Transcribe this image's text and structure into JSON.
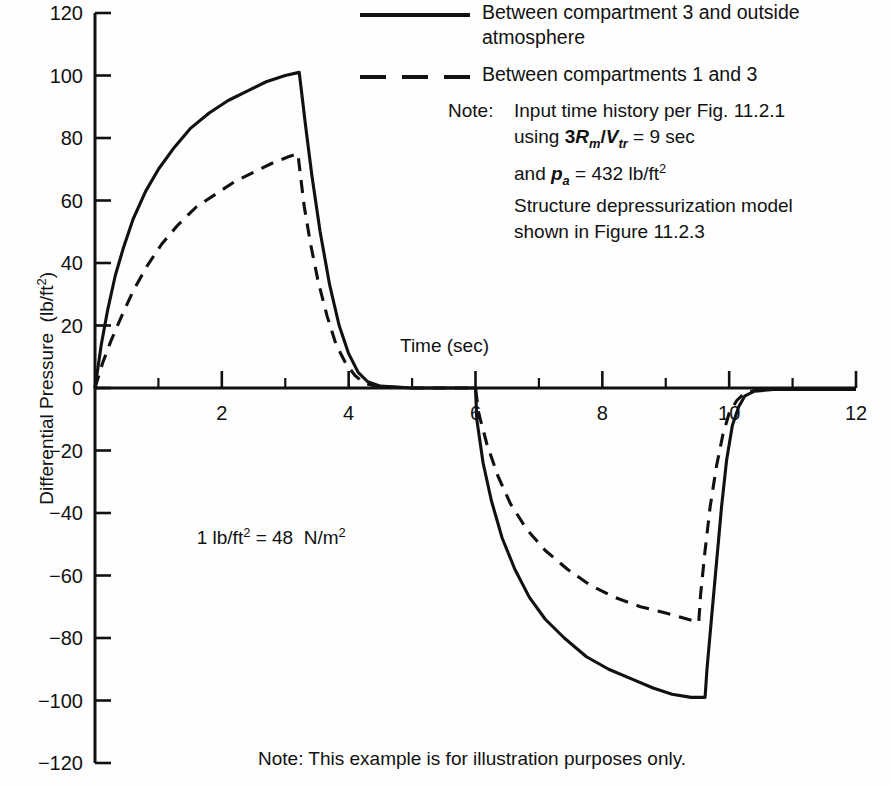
{
  "chart_data": {
    "type": "line",
    "title": "",
    "xlabel": "Time (sec)",
    "ylabel": "Differential Pressure (lb/ft2)",
    "ylabel_display": "Differential Pressure  (lb/ft",
    "ylabel_exponent": "2",
    "ylabel_close": ")",
    "xlim": [
      0,
      12
    ],
    "ylim": [
      -120,
      120
    ],
    "xticks": [
      0,
      2,
      4,
      6,
      8,
      10,
      12
    ],
    "xticklabels": [
      "",
      "2",
      "4",
      "6",
      "8",
      "10",
      "12"
    ],
    "xminorticks": [
      1,
      3,
      5,
      7,
      9,
      11
    ],
    "yticks": [
      120,
      100,
      80,
      60,
      40,
      20,
      0,
      -20,
      -40,
      -60,
      -80,
      -100,
      -120
    ],
    "yticklabels": [
      "120",
      "100",
      "80",
      "60",
      "40",
      "20",
      "0",
      "−20",
      "−40",
      "−60",
      "−80",
      "−100",
      "−120"
    ],
    "grid": false,
    "legend_position": "top-right",
    "line_color": "#111111",
    "series": [
      {
        "name": "Between compartment 3 and outside atmosphere",
        "style": "solid",
        "points": [
          [
            0.0,
            0
          ],
          [
            0.1,
            14
          ],
          [
            0.2,
            25
          ],
          [
            0.32,
            36
          ],
          [
            0.45,
            45
          ],
          [
            0.6,
            54
          ],
          [
            0.8,
            63
          ],
          [
            1.0,
            70
          ],
          [
            1.25,
            77
          ],
          [
            1.5,
            83
          ],
          [
            1.8,
            88
          ],
          [
            2.1,
            92
          ],
          [
            2.4,
            95
          ],
          [
            2.7,
            98
          ],
          [
            3.0,
            100
          ],
          [
            3.22,
            101
          ],
          [
            3.25,
            96
          ],
          [
            3.32,
            84
          ],
          [
            3.42,
            68
          ],
          [
            3.55,
            50
          ],
          [
            3.7,
            33
          ],
          [
            3.85,
            20
          ],
          [
            4.0,
            11
          ],
          [
            4.15,
            5
          ],
          [
            4.3,
            2
          ],
          [
            4.5,
            0.6
          ],
          [
            5.0,
            0
          ],
          [
            6.0,
            0
          ],
          [
            6.02,
            -10
          ],
          [
            6.12,
            -24
          ],
          [
            6.25,
            -36
          ],
          [
            6.42,
            -48
          ],
          [
            6.62,
            -58
          ],
          [
            6.85,
            -67
          ],
          [
            7.1,
            -74
          ],
          [
            7.4,
            -80
          ],
          [
            7.75,
            -86
          ],
          [
            8.1,
            -90
          ],
          [
            8.45,
            -93
          ],
          [
            8.8,
            -96
          ],
          [
            9.1,
            -98
          ],
          [
            9.4,
            -99
          ],
          [
            9.62,
            -99
          ],
          [
            9.65,
            -90
          ],
          [
            9.72,
            -74
          ],
          [
            9.8,
            -56
          ],
          [
            9.88,
            -38
          ],
          [
            9.96,
            -23
          ],
          [
            10.05,
            -12
          ],
          [
            10.15,
            -6
          ],
          [
            10.25,
            -2.5
          ],
          [
            10.4,
            -1
          ],
          [
            10.7,
            -0.5
          ],
          [
            11.2,
            -0.5
          ],
          [
            12.0,
            -0.5
          ]
        ]
      },
      {
        "name": "Between compartments 1 and 3",
        "style": "dashed",
        "points": [
          [
            0.0,
            0
          ],
          [
            0.12,
            8
          ],
          [
            0.25,
            15
          ],
          [
            0.42,
            23
          ],
          [
            0.6,
            31
          ],
          [
            0.82,
            39
          ],
          [
            1.05,
            46
          ],
          [
            1.3,
            52
          ],
          [
            1.6,
            58
          ],
          [
            1.9,
            62
          ],
          [
            2.2,
            66
          ],
          [
            2.5,
            69
          ],
          [
            2.8,
            72
          ],
          [
            3.05,
            74
          ],
          [
            3.2,
            75
          ],
          [
            3.24,
            68
          ],
          [
            3.3,
            58
          ],
          [
            3.4,
            46
          ],
          [
            3.52,
            34
          ],
          [
            3.66,
            23
          ],
          [
            3.8,
            14
          ],
          [
            3.95,
            8
          ],
          [
            4.1,
            4
          ],
          [
            4.25,
            1.5
          ],
          [
            4.45,
            0.5
          ],
          [
            5.0,
            0
          ],
          [
            6.0,
            0
          ],
          [
            6.05,
            -8
          ],
          [
            6.18,
            -18
          ],
          [
            6.35,
            -28
          ],
          [
            6.55,
            -37
          ],
          [
            6.8,
            -45
          ],
          [
            7.1,
            -52
          ],
          [
            7.45,
            -58
          ],
          [
            7.8,
            -63
          ],
          [
            8.2,
            -67
          ],
          [
            8.6,
            -70
          ],
          [
            9.0,
            -72
          ],
          [
            9.35,
            -74
          ],
          [
            9.52,
            -75
          ],
          [
            9.55,
            -66
          ],
          [
            9.62,
            -52
          ],
          [
            9.7,
            -38
          ],
          [
            9.8,
            -25
          ],
          [
            9.9,
            -15
          ],
          [
            10.0,
            -8
          ],
          [
            10.12,
            -4
          ],
          [
            10.25,
            -1.5
          ],
          [
            10.45,
            -0.6
          ],
          [
            10.9,
            -0.4
          ],
          [
            11.5,
            -0.4
          ],
          [
            12.0,
            -0.4
          ]
        ]
      }
    ],
    "annotations": [
      "1 lb/ft2 = 48 N/m2",
      "Note: Input time history per Fig. 11.2.1 using 3Rm/Vtr = 9 sec and pa = 432 lb/ft2 Structure depressurization model shown in Figure 11.2.3",
      "Note: This example is for illustration purposes only."
    ]
  },
  "legend": {
    "items": [
      {
        "style": "solid",
        "line1": "Between compartment 3 and outside",
        "line2": "atmosphere"
      },
      {
        "style": "dashed",
        "line1": "Between compartments 1 and 3",
        "line2": ""
      }
    ]
  },
  "note_block": {
    "label": "Note:",
    "line1": "Input time history per Fig. 11.2.1",
    "line2_pre": "using ",
    "line2_num": "3",
    "line2_var1": "R",
    "line2_sub1": "m",
    "line2_slash": "/",
    "line2_var2": "V",
    "line2_sub2": "tr",
    "line2_post": " = 9 sec",
    "line3_pre": "and ",
    "line3_var": "p",
    "line3_sub": "a",
    "line3_post": " = 432 lb/ft",
    "line3_sup": "2",
    "line4": "Structure depressurization model",
    "line5": "shown in Figure 11.2.3"
  },
  "unit_note": {
    "left": "1 lb/ft",
    "left_sup": "2",
    "equals": " = 48  N/m",
    "right_sup": "2"
  },
  "bottom_note": {
    "text": "Note: This example is for illustration purposes only."
  }
}
